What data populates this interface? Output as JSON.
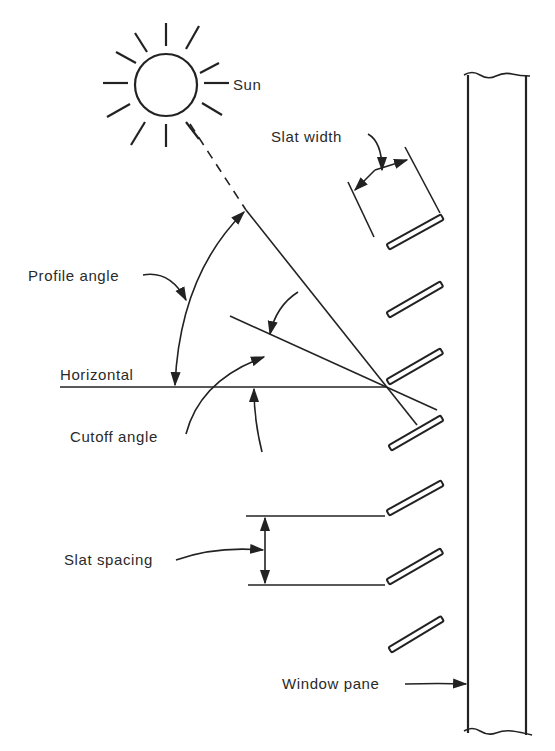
{
  "diagram": {
    "type": "louver-shading-geometry",
    "labels": {
      "sun": "Sun",
      "slat_width": "Slat width",
      "profile_angle": "Profile angle",
      "horizontal": "Horizontal",
      "cutoff_angle": "Cutoff angle",
      "slat_spacing": "Slat spacing",
      "window_pane": "Window pane"
    },
    "slat_count": 7,
    "colors": {
      "ink": "#222222",
      "background": "#ffffff"
    }
  }
}
